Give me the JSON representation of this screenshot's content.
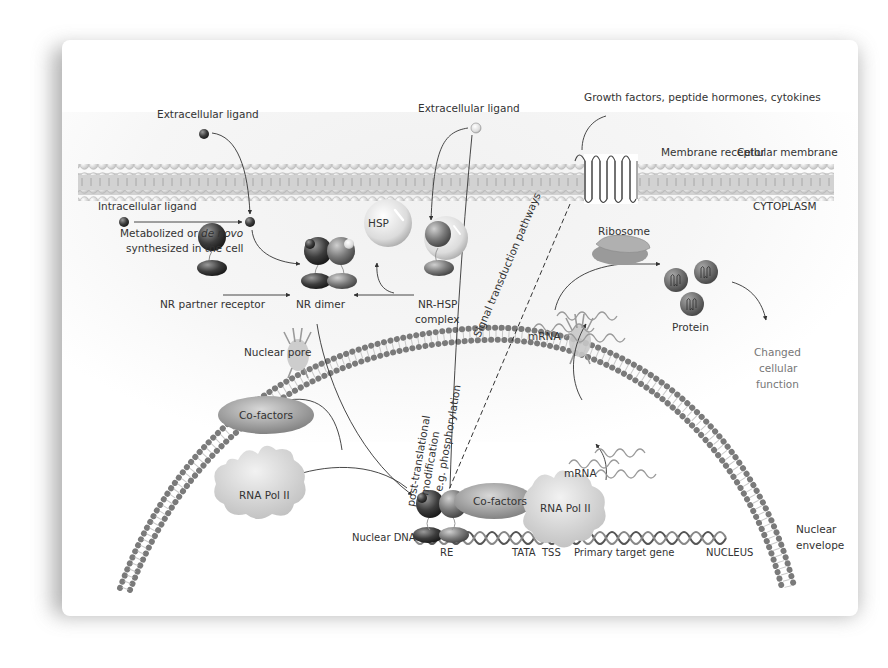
{
  "diagram": {
    "colors": {
      "background": "#ffffff",
      "card_shadow": "#9a9a9a",
      "membrane_head": "#e8e8e8",
      "membrane_band": "#cfcfcf",
      "envelope_bead": "#8c8c8c",
      "molecule_dark": "#3d3d3d",
      "molecule_mid": "#7a7a7a",
      "blob_fill": "#d6d6d6",
      "text": "#333333",
      "text_light": "#777777"
    },
    "labels": {
      "extracellular_ligand_left": "Extracellular ligand",
      "extracellular_ligand_center": "Extracellular ligand",
      "growth_factors": "Growth factors, peptide hormones, cytokines",
      "membrane_receptor": "Membrane receptor",
      "cellular_membrane": "Cellular membrane",
      "cytoplasm": "CYTOPLASM",
      "intracellular_ligand": "Intracellular ligand",
      "metabolized_prefix": "Metabolized or ",
      "metabolized_italic": "de novo",
      "synthesized": "synthesized in the cell",
      "hsp": "HSP",
      "nr_partner_receptor": "NR partner receptor",
      "nr_dimer": "NR dimer",
      "nr_hsp_line1": "NR-HSP",
      "nr_hsp_line2": "complex",
      "signal_transduction": "Signal transduction pathways",
      "ribosome": "Ribosome",
      "mrna_cytoplasm": "mRNA",
      "protein": "Protein",
      "changed_line1": "Changed",
      "changed_line2": "cellular",
      "changed_line3": "function",
      "nuclear_pore": "Nuclear pore",
      "ptm_line1": "post-translational",
      "ptm_line2": "modification",
      "ptm_line3": "e.g. phosphorylation",
      "mrna_nucleus": "mRNA",
      "cofactors_left": "Co-factors",
      "cofactors_complex": "Co-factors",
      "rna_pol_left": "RNA Pol II",
      "rna_pol_complex": "RNA Pol II",
      "nuclear_dna": "Nuclear DNA",
      "re": "RE",
      "tata": "TATA",
      "tss": "TSS",
      "primary_target_gene": "Primary target gene",
      "nucleus": "NUCLEUS",
      "nuclear_envelope_line1": "Nuclear",
      "nuclear_envelope_line2": "envelope"
    }
  }
}
